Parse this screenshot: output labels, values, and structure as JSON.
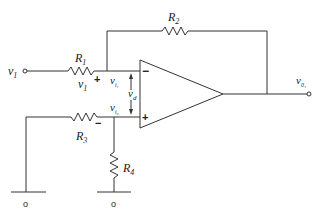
{
  "diagram": {
    "type": "op-amp differential amplifier circuit",
    "components": {
      "R1": {
        "label": "R",
        "sub": "1"
      },
      "R2": {
        "label": "R",
        "sub": "2"
      },
      "R3": {
        "label": "R",
        "sub": "3"
      },
      "R4": {
        "label": "R",
        "sub": "4"
      }
    },
    "nodes": {
      "input": {
        "label": "v",
        "sub": "1"
      },
      "r1_voltage": {
        "label": "v",
        "sub": "1"
      },
      "inverting_node": {
        "label": "v",
        "sub": "i₁"
      },
      "noninverting_node": {
        "label": "v",
        "sub": "i₂"
      },
      "differential": {
        "label": "v",
        "sub": "d"
      },
      "output": {
        "label": "v",
        "sub": "0₁"
      }
    },
    "polarity": {
      "r1_plus": "+",
      "r3_minus": "−",
      "opamp_inverting": "−",
      "opamp_noninverting": "+"
    },
    "ground_terminals": [
      "o",
      "o"
    ]
  }
}
